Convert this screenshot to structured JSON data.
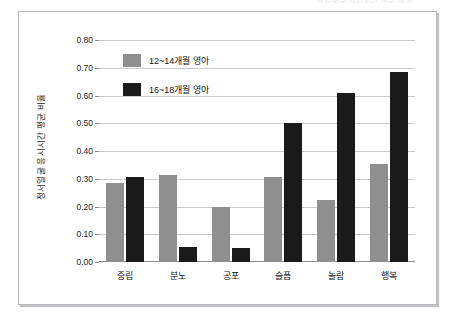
{
  "top_caption": "정서얼굴 응시시간 평균 비율",
  "chart_data": {
    "type": "bar",
    "title": "",
    "xlabel": "",
    "ylabel": "정서얼굴 응시시간 평균 비율",
    "ylim": [
      0.0,
      0.8
    ],
    "ytick_labels": [
      "0.80",
      "0.70",
      "0.60",
      "0.50",
      "0.40",
      "0.30",
      "0.20",
      "0.10",
      "0.00"
    ],
    "ytick_values": [
      0.8,
      0.7,
      0.6,
      0.5,
      0.4,
      0.3,
      0.2,
      0.1,
      0.0
    ],
    "grid": true,
    "legend_position": "top-left-inside",
    "categories": [
      "중립",
      "분노",
      "공포",
      "슬픔",
      "놀람",
      "행복"
    ],
    "series": [
      {
        "name": "12~14개월 영아",
        "color": "#8f8f8f",
        "values": [
          0.285,
          0.312,
          0.2,
          0.305,
          0.225,
          0.352
        ]
      },
      {
        "name": "16~18개월 영아",
        "color": "#1a1a1a",
        "values": [
          0.305,
          0.055,
          0.052,
          0.5,
          0.608,
          0.685
        ]
      }
    ]
  }
}
